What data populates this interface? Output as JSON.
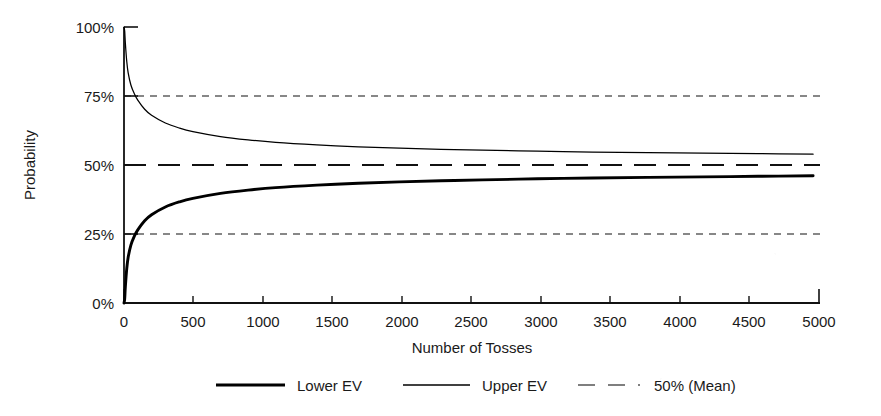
{
  "chart_data": {
    "type": "line",
    "title": "",
    "xlabel": "Number of Tosses",
    "ylabel": "Probability",
    "xlim": [
      0,
      5050
    ],
    "ylim": [
      0,
      100
    ],
    "grid": "horizontal dashed gridlines at 25% and 75%; long-dashed mean line at 50%",
    "legend_position": "bottom",
    "x_ticks": [
      "0",
      "500",
      "1000",
      "1500",
      "2000",
      "2500",
      "3000",
      "3500",
      "4000",
      "4500",
      "5000"
    ],
    "x_tick_values": [
      0,
      500,
      1000,
      1500,
      2000,
      2500,
      3000,
      3500,
      4000,
      4500,
      5000
    ],
    "y_ticks": [
      "0%",
      "25%",
      "50%",
      "75%",
      "100%"
    ],
    "y_tick_values": [
      0,
      25,
      50,
      75,
      100
    ],
    "series": [
      {
        "name": "Lower EV",
        "style": "solid-thick",
        "color": "#000000",
        "x": [
          5,
          10,
          20,
          30,
          50,
          75,
          100,
          150,
          200,
          300,
          400,
          500,
          700,
          900,
          1100,
          1400,
          1700,
          2000,
          2300,
          2600,
          3000,
          3400,
          3800,
          4200,
          4600,
          5000
        ],
        "values": [
          1.5,
          6.0,
          12.5,
          16.5,
          21.0,
          24.2,
          26.5,
          29.8,
          32.0,
          34.8,
          36.6,
          37.9,
          39.7,
          40.9,
          41.8,
          42.7,
          43.4,
          43.9,
          44.3,
          44.6,
          45.0,
          45.3,
          45.5,
          45.7,
          45.9,
          46.1
        ]
      },
      {
        "name": "Upper EV",
        "style": "solid-thin",
        "color": "#000000",
        "x": [
          5,
          10,
          20,
          30,
          50,
          75,
          100,
          150,
          200,
          300,
          400,
          500,
          700,
          900,
          1100,
          1400,
          1700,
          2000,
          2300,
          2600,
          3000,
          3400,
          3800,
          4200,
          4600,
          5000
        ],
        "values": [
          98.5,
          94.0,
          87.5,
          83.5,
          79.0,
          75.8,
          73.5,
          70.2,
          68.0,
          65.2,
          63.4,
          62.1,
          60.3,
          59.1,
          58.2,
          57.3,
          56.6,
          56.1,
          55.7,
          55.4,
          55.0,
          54.7,
          54.5,
          54.3,
          54.1,
          53.9
        ]
      },
      {
        "name": "50% (Mean)",
        "style": "dashed",
        "color": "#000000",
        "x": [
          0,
          5050
        ],
        "values": [
          50,
          50
        ]
      }
    ],
    "legend": [
      {
        "label": "Lower EV",
        "style": "solid-thick"
      },
      {
        "label": "Upper EV",
        "style": "solid-thin"
      },
      {
        "label": "50% (Mean)",
        "style": "dashed"
      }
    ]
  }
}
